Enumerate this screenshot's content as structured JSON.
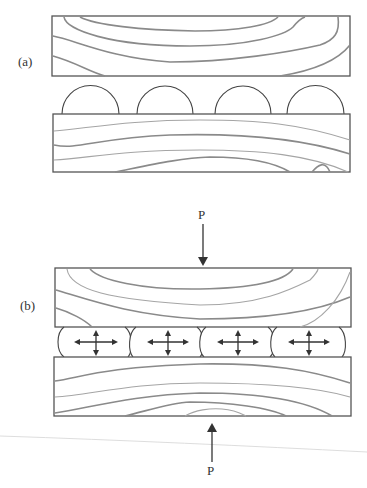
{
  "figure": {
    "panels": [
      {
        "id": "a",
        "label": "(a)",
        "description": "Two wood blocks separated, with four undeformed semicircular bumps on the lower block"
      },
      {
        "id": "b",
        "label": "(b)",
        "description": "Blocks pressed together by opposing loads P; bumps flattened with bidirectional spreading arrows"
      }
    ],
    "load_top_label": "P",
    "load_bottom_label": "P",
    "bump_count": 4,
    "colors": {
      "outline": "#555555",
      "grain": "#8a8a8a",
      "arrow": "#333333",
      "background": "#ffffff"
    }
  }
}
